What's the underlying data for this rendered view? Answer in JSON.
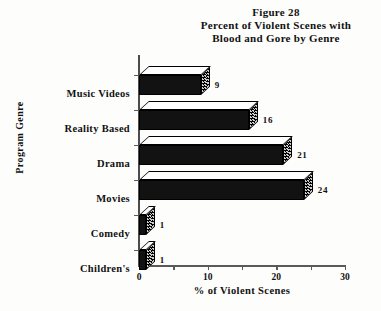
{
  "figure": {
    "title_lines": [
      "Figure 28",
      "Percent of Violent Scenes with",
      "Blood and Gore by Genre"
    ]
  },
  "chart_data": {
    "type": "bar",
    "orientation": "horizontal",
    "title": "Figure 28 Percent of Violent Scenes with Blood and Gore by Genre",
    "xlabel": "% of Violent Scenes",
    "ylabel": "Program Genre",
    "categories": [
      "Music Videos",
      "Reality Based",
      "Drama",
      "Movies",
      "Comedy",
      "Children's"
    ],
    "values": [
      9,
      16,
      21,
      24,
      1,
      1
    ],
    "data_labels": [
      "9",
      "16",
      "21",
      "24",
      "1",
      "1"
    ],
    "xlim": [
      0,
      30
    ],
    "xticks": [
      0,
      5,
      10,
      15,
      20,
      25,
      30
    ],
    "xtick_labels": [
      "0",
      "",
      "10",
      "",
      "20",
      "",
      "30"
    ],
    "grid": false,
    "legend": "none",
    "style": "3d-shaded-bars",
    "colors": {
      "bar_front": "#121212",
      "bar_top": "#ffffff",
      "bar_side": "#cfcfcf",
      "axis": "#5a5a5a",
      "text": "#111111",
      "background": "#fdfdfc"
    }
  }
}
